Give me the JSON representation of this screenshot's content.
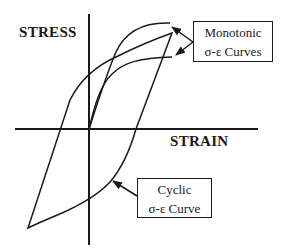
{
  "diagram": {
    "y_axis_label": "STRESS",
    "x_axis_label": "STRAIN",
    "callouts": {
      "monotonic": {
        "line1": "Monotonic",
        "line2": "σ-ε Curves"
      },
      "cyclic": {
        "line1": "Cyclic",
        "line2": "σ-ε Curve"
      }
    },
    "colors": {
      "stroke": "#1a1a1a",
      "background": "#ffffff"
    }
  }
}
